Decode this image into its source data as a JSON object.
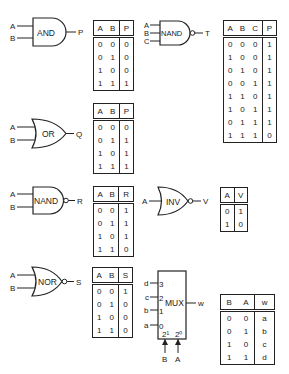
{
  "gates": {
    "and": {
      "label": "AND",
      "inputs": [
        "A",
        "B"
      ],
      "output": "P"
    },
    "nand3": {
      "label": "NAND",
      "inputs": [
        "A",
        "B",
        "C"
      ],
      "output": "T"
    },
    "or": {
      "label": "OR",
      "inputs": [
        "A",
        "B"
      ],
      "output": "Q"
    },
    "nand": {
      "label": "NAND",
      "inputs": [
        "A",
        "B"
      ],
      "output": "R"
    },
    "inv": {
      "label": "INV",
      "inputs": [
        "A"
      ],
      "output": "V"
    },
    "nor": {
      "label": "NOR",
      "inputs": [
        "A",
        "B"
      ],
      "output": "S"
    },
    "mux": {
      "label": "MUX",
      "data_inputs": [
        "d",
        "c",
        "b",
        "a"
      ],
      "data_pins": [
        "3",
        "2",
        "1",
        "0"
      ],
      "select_pins": [
        "2¹",
        "2⁰"
      ],
      "select_inputs": [
        "B",
        "A"
      ],
      "output": "w"
    }
  },
  "tables": {
    "and": {
      "headers": [
        "A",
        "B",
        "P"
      ],
      "rows": [
        [
          "0",
          "0",
          "0"
        ],
        [
          "0",
          "1",
          "0"
        ],
        [
          "1",
          "0",
          "0"
        ],
        [
          "1",
          "1",
          "1"
        ]
      ]
    },
    "nand3": {
      "headers": [
        "A",
        "B",
        "C",
        "P"
      ],
      "rows": [
        [
          "0",
          "0",
          "0",
          "1"
        ],
        [
          "1",
          "0",
          "0",
          "1"
        ],
        [
          "0",
          "1",
          "0",
          "1"
        ],
        [
          "0",
          "0",
          "1",
          "1"
        ],
        [
          "1",
          "1",
          "0",
          "1"
        ],
        [
          "1",
          "0",
          "1",
          "1"
        ],
        [
          "0",
          "1",
          "1",
          "1"
        ],
        [
          "1",
          "1",
          "1",
          "0"
        ]
      ]
    },
    "or": {
      "headers": [
        "A",
        "B",
        "P"
      ],
      "rows": [
        [
          "0",
          "0",
          "0"
        ],
        [
          "0",
          "1",
          "1"
        ],
        [
          "1",
          "0",
          "1"
        ],
        [
          "1",
          "1",
          "1"
        ]
      ]
    },
    "nand": {
      "headers": [
        "A",
        "B",
        "R"
      ],
      "rows": [
        [
          "0",
          "0",
          "1"
        ],
        [
          "0",
          "1",
          "1"
        ],
        [
          "1",
          "0",
          "1"
        ],
        [
          "1",
          "1",
          "0"
        ]
      ]
    },
    "inv": {
      "headers": [
        "A",
        "V"
      ],
      "rows": [
        [
          "0",
          "1"
        ],
        [
          "1",
          "0"
        ]
      ]
    },
    "nor": {
      "headers": [
        "A",
        "B",
        "S"
      ],
      "rows": [
        [
          "0",
          "0",
          "1"
        ],
        [
          "0",
          "1",
          "0"
        ],
        [
          "1",
          "0",
          "0"
        ],
        [
          "1",
          "1",
          "0"
        ]
      ]
    },
    "mux": {
      "headers": [
        "B",
        "A",
        "w"
      ],
      "rows": [
        [
          "0",
          "0",
          "a"
        ],
        [
          "0",
          "1",
          "b"
        ],
        [
          "1",
          "0",
          "c"
        ],
        [
          "1",
          "1",
          "d"
        ]
      ]
    }
  }
}
